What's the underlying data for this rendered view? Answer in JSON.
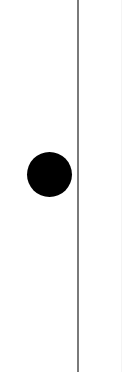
{
  "canvas": {
    "width": 124,
    "height": 372,
    "background": "#ffffff"
  },
  "elements": {
    "divider_line": {
      "orientation": "vertical",
      "x": 78,
      "color": "#7a7a7a"
    },
    "dot": {
      "shape": "circle",
      "center_x": 49,
      "center_y": 174,
      "diameter": 45,
      "color": "#000000"
    }
  }
}
